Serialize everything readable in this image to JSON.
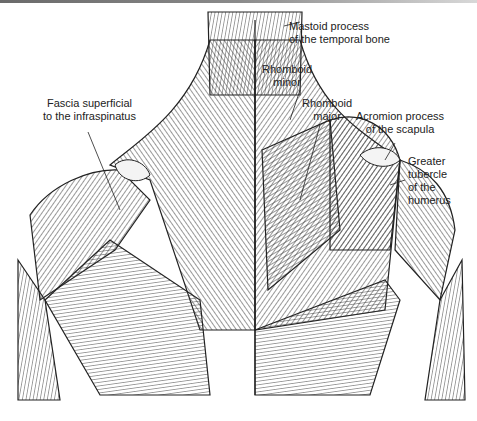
{
  "figure": {
    "labels": [
      {
        "id": "mastoid",
        "lines": [
          "Mastoid process",
          "of the temporal bone"
        ]
      },
      {
        "id": "rhomboid-minor",
        "lines": [
          "Rhomboid",
          "minor"
        ]
      },
      {
        "id": "rhomboid-major",
        "lines": [
          "Rhomboid",
          "major"
        ]
      },
      {
        "id": "fascia",
        "lines": [
          "Fascia superficial",
          "to the infraspinatus"
        ]
      },
      {
        "id": "acromion",
        "lines": [
          "Acromion process",
          "of the scapula"
        ]
      },
      {
        "id": "greater-tubercle",
        "lines": [
          "Greater",
          "tubercle",
          "of the",
          "humerus"
        ]
      }
    ]
  }
}
